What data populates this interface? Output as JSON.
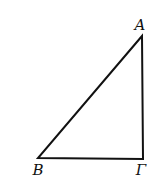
{
  "figure": {
    "type": "right-triangle",
    "right_angle_at": "Γ",
    "stroke_color": "#111111",
    "background": "#ffffff"
  },
  "vertices": [
    {
      "name": "A",
      "label": "A",
      "x": 142,
      "y": 36,
      "label_x": 140,
      "label_y": 30
    },
    {
      "name": "B",
      "label": "B",
      "x": 38,
      "y": 158,
      "label_x": 38,
      "label_y": 175
    },
    {
      "name": "Gamma",
      "label": "Γ",
      "x": 143,
      "y": 159,
      "label_x": 141,
      "label_y": 175
    }
  ],
  "sides": [
    "AB",
    "BΓ",
    "ΓA"
  ]
}
